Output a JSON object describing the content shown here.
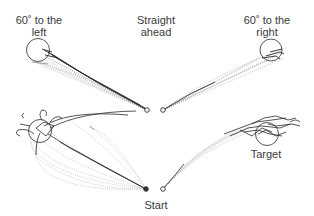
{
  "labels": {
    "left_line1": "60˚ to the",
    "left_line2": "left",
    "center_line1": "Straight",
    "center_line2": "ahead",
    "right_line1": "60˚ to the",
    "right_line2": "right",
    "target": "Target",
    "start": "Start"
  },
  "panels": [
    {
      "name": "top-left",
      "start": [
        147,
        110
      ],
      "target": [
        37,
        50
      ],
      "target_radius": 12,
      "condition": "60˚ to the left"
    },
    {
      "name": "top-right",
      "start": [
        163,
        110
      ],
      "target": [
        271,
        50
      ],
      "target_radius": 11,
      "condition": "60˚ to the right"
    },
    {
      "name": "bottom-left",
      "start": [
        146,
        189
      ],
      "target": [
        40,
        131
      ],
      "target_radius": 12,
      "condition": "Straight ahead"
    },
    {
      "name": "bottom-right",
      "start": [
        163,
        189
      ],
      "target": [
        266,
        133
      ],
      "target_radius": 12,
      "condition": "Straight ahead"
    }
  ],
  "colors": {
    "ink": "#2a2a2a",
    "trace_light": "#9a9a9a",
    "text": "#3a3a3a"
  }
}
